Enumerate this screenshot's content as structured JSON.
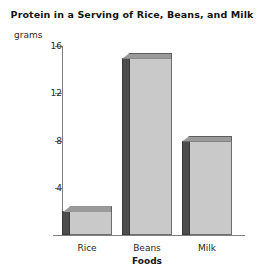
{
  "chart_data": {
    "type": "bar",
    "title": "Protein in a Serving of Rice, Beans, and Milk",
    "xlabel": "Foods",
    "ylabel": "grams",
    "categories": [
      "Rice",
      "Beans",
      "Milk"
    ],
    "values": [
      2,
      15,
      8
    ],
    "yticks": [
      4,
      8,
      12,
      16
    ],
    "ylim": [
      0,
      16
    ],
    "grid": false,
    "legend": false,
    "colors": {
      "bar_face": "#c9c9c9",
      "bar_side": "#4d4d4d",
      "bar_top": "#9a9a9a",
      "axis": "#808080",
      "text": "#1a1a1a",
      "background": "#ffffff"
    }
  }
}
